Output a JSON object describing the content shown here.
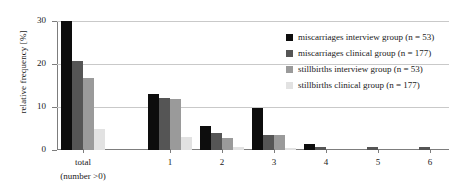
{
  "chart_data": {
    "type": "bar",
    "title": "",
    "xlabel": "",
    "ylabel": "relative frequency [%]",
    "categories": [
      "total\n(number >0)",
      "1",
      "2",
      "3",
      "4",
      "5",
      "6"
    ],
    "category_labels": [
      {
        "line1": "total",
        "line2": "(number >0)"
      },
      {
        "line1": "1",
        "line2": ""
      },
      {
        "line1": "2",
        "line2": ""
      },
      {
        "line1": "3",
        "line2": ""
      },
      {
        "line1": "4",
        "line2": ""
      },
      {
        "line1": "5",
        "line2": ""
      },
      {
        "line1": "6",
        "line2": ""
      }
    ],
    "series": [
      {
        "name": "miscarriages interview group (n = 53)",
        "color": "#0d0d0d",
        "values": [
          30.0,
          13.0,
          5.6,
          9.8,
          1.4,
          0.0,
          0.0
        ]
      },
      {
        "name": "miscarriages clinical group (n = 177)",
        "color": "#555555",
        "values": [
          20.7,
          12.2,
          4.0,
          3.5,
          0.6,
          0.6,
          0.6
        ]
      },
      {
        "name": "stillbirths interview group (n = 53)",
        "color": "#9a9a9a",
        "values": [
          16.8,
          11.8,
          2.8,
          3.6,
          0.0,
          0.0,
          0.0
        ]
      },
      {
        "name": "stillbirths clinical group (n = 177)",
        "color": "#e2e2e2",
        "values": [
          4.8,
          3.0,
          0.8,
          0.5,
          0.0,
          0.0,
          0.0
        ]
      }
    ],
    "ylim": [
      0,
      30
    ],
    "yticks": [
      0,
      10,
      20,
      30
    ],
    "ytick_labels": [
      "0",
      "10",
      "20",
      "30"
    ],
    "grid": true,
    "grid_axis": "y",
    "legend_position": "top-right",
    "note": "first black bar is clipped at the 30% axis maximum"
  },
  "legend": {
    "items": [
      {
        "label": "miscarriages interview group (n = 53)",
        "color": "#0d0d0d"
      },
      {
        "label": "miscarriages clinical group (n = 177)",
        "color": "#555555"
      },
      {
        "label": "stillbirths interview group (n = 53)",
        "color": "#9a9a9a"
      },
      {
        "label": "stillbirths clinical group (n = 177)",
        "color": "#e2e2e2"
      }
    ]
  }
}
